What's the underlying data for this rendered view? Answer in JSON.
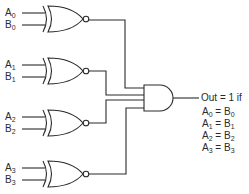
{
  "diagram": {
    "type": "logic-circuit",
    "stroke_color": "#2a2a2a",
    "gates": [
      {
        "type": "XNOR",
        "inputs": [
          {
            "name": "A",
            "sub": "0"
          },
          {
            "name": "B",
            "sub": "0"
          }
        ]
      },
      {
        "type": "XNOR",
        "inputs": [
          {
            "name": "A",
            "sub": "1"
          },
          {
            "name": "B",
            "sub": "1"
          }
        ]
      },
      {
        "type": "XNOR",
        "inputs": [
          {
            "name": "A",
            "sub": "2"
          },
          {
            "name": "B",
            "sub": "2"
          }
        ]
      },
      {
        "type": "XNOR",
        "inputs": [
          {
            "name": "A",
            "sub": "3"
          },
          {
            "name": "B",
            "sub": "3"
          }
        ]
      },
      {
        "type": "AND",
        "inputs": 4
      }
    ],
    "output": {
      "title": "Out = 1 if",
      "conditions": [
        {
          "a": "A",
          "a_sub": "0",
          "eq": " = ",
          "b": "B",
          "b_sub": "0"
        },
        {
          "a": "A",
          "a_sub": "1",
          "eq": " = ",
          "b": "B",
          "b_sub": "1"
        },
        {
          "a": "A",
          "a_sub": "2",
          "eq": " = ",
          "b": "B",
          "b_sub": "2"
        },
        {
          "a": "A",
          "a_sub": "3",
          "eq": " = ",
          "b": "B",
          "b_sub": "3"
        }
      ]
    }
  }
}
